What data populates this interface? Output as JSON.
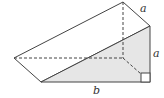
{
  "diagram": {
    "type": "triangular prism",
    "labels": {
      "top_edge": "a",
      "right_edge": "a",
      "bottom_edge": "b"
    },
    "colors": {
      "shaded_face": "#e6e6e6",
      "line": "#444444"
    },
    "right_angle_marker": true
  }
}
